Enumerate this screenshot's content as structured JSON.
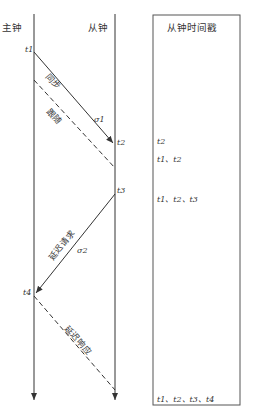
{
  "master": {
    "label": "主钟"
  },
  "slave": {
    "label": "从钟"
  },
  "timestamps_box": {
    "title": "从钟时间戳",
    "entries": [
      "t2",
      "t1、t2",
      "t1、t2、t3",
      "t1、t2、t3、t4"
    ]
  },
  "events": {
    "t1": "t1",
    "t2": "t2",
    "t3": "t3",
    "t4": "t4"
  },
  "messages": {
    "sync": {
      "label": "同步",
      "delay_symbol": "σ1"
    },
    "follow_up": {
      "label": "跟随"
    },
    "delay_req": {
      "label": "延迟请求",
      "delay_symbol": "σ2"
    },
    "delay_resp": {
      "label": "延迟响应"
    }
  },
  "colors": {
    "line": "#333333",
    "text": "#333333",
    "background": "#ffffff"
  }
}
